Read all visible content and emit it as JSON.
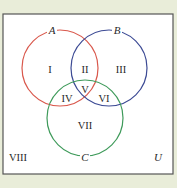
{
  "diagram": {
    "type": "venn",
    "universe_label": "U",
    "sets": [
      {
        "label": "A",
        "color": "#d9584c"
      },
      {
        "label": "B",
        "color": "#3c4a94"
      },
      {
        "label": "C",
        "color": "#3e9a5a"
      }
    ],
    "regions": {
      "I": "I",
      "II": "II",
      "III": "III",
      "IV": "IV",
      "V": "V",
      "VI": "VI",
      "VII": "VII",
      "VIII": "VIII"
    },
    "colors": {
      "background": "#e9edd9",
      "box_fill": "#ffffff",
      "box_border": "#555555"
    }
  }
}
